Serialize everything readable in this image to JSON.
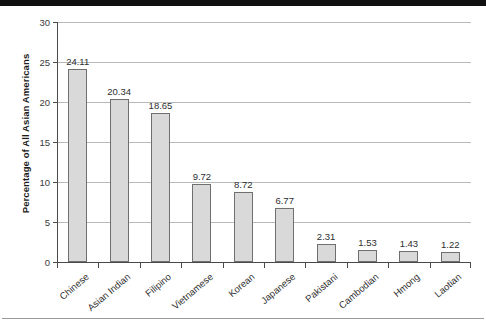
{
  "chart_data": {
    "type": "bar",
    "title": "",
    "subtitle": "",
    "xlabel": "",
    "ylabel": "Percentage of All Asian Americans",
    "ylim": [
      0,
      30
    ],
    "yticks": [
      0,
      5,
      10,
      15,
      20,
      25,
      30
    ],
    "ytick_labels": [
      "0",
      "5",
      "10",
      "15",
      "20",
      "25",
      "30"
    ],
    "grid": "horizontal",
    "legend": "none",
    "categories": [
      "Chinese",
      "Asian Indian",
      "Filipino",
      "Vietnamese",
      "Korean",
      "Japanese",
      "Pakistani",
      "Cambodian",
      "Hmong",
      "Laotian"
    ],
    "values": [
      24.11,
      20.34,
      18.65,
      9.72,
      8.72,
      6.77,
      2.31,
      1.53,
      1.43,
      1.22
    ],
    "value_labels": [
      "24.11",
      "20.34",
      "18.65",
      "9.72",
      "8.72",
      "6.77",
      "2.31",
      "1.53",
      "1.43",
      "1.22"
    ],
    "colors": {
      "bar_fill": "#d9d9d9",
      "bar_stroke": "#6f6f6f",
      "gridline": "#b9b9b9",
      "axis": "#4a4a4a",
      "text": "#2e2e2e",
      "background": "#ffffff"
    }
  }
}
